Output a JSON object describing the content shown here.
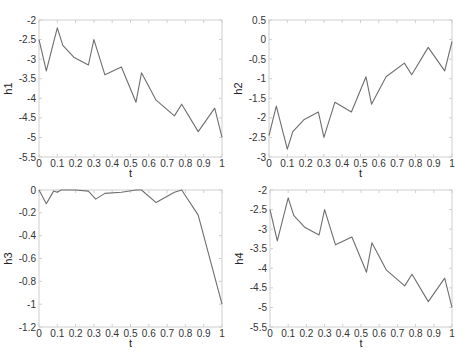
{
  "chart_data": [
    {
      "type": "line",
      "title": "",
      "xlabel": "t",
      "ylabel": "h1",
      "xlim": [
        0,
        1
      ],
      "ylim": [
        -5.5,
        -2
      ],
      "xticks": [
        0,
        0.1,
        0.2,
        0.3,
        0.4,
        0.5,
        0.6,
        0.7,
        0.8,
        0.9,
        1
      ],
      "xtick_labels": [
        "0",
        "0.1",
        "0.2",
        "0.3",
        "0.4",
        "0.5",
        "0.6",
        "0.7",
        "0.8",
        "0.9",
        "1"
      ],
      "yticks": [
        -5.5,
        -5,
        -4.5,
        -4,
        -3.5,
        -3,
        -2.5,
        -2
      ],
      "ytick_labels": [
        "-5.5",
        "-5",
        "-4.5",
        "-4",
        "-3.5",
        "-3",
        "-2.5",
        "-2"
      ],
      "grid": false,
      "x": [
        0,
        0.04,
        0.1,
        0.13,
        0.19,
        0.27,
        0.3,
        0.36,
        0.45,
        0.53,
        0.56,
        0.64,
        0.74,
        0.78,
        0.87,
        0.96,
        1.0
      ],
      "y": [
        -2.5,
        -3.3,
        -2.2,
        -2.65,
        -2.95,
        -3.15,
        -2.5,
        -3.4,
        -3.2,
        -4.1,
        -3.35,
        -4.05,
        -4.45,
        -4.15,
        -4.85,
        -4.25,
        -5.0
      ],
      "box": {
        "left": 39,
        "top": 20,
        "right": 222,
        "bottom": 157
      }
    },
    {
      "type": "line",
      "title": "",
      "xlabel": "t",
      "ylabel": "h2",
      "xlim": [
        0,
        1
      ],
      "ylim": [
        -3,
        0.5
      ],
      "xticks": [
        0,
        0.1,
        0.2,
        0.3,
        0.4,
        0.5,
        0.6,
        0.7,
        0.8,
        0.9,
        1
      ],
      "xtick_labels": [
        "0",
        "0.1",
        "0.2",
        "0.3",
        "0.4",
        "0.5",
        "0.6",
        "0.7",
        "0.8",
        "0.9",
        "1"
      ],
      "yticks": [
        -3,
        -2.5,
        -2,
        -1.5,
        -1,
        -0.5,
        0,
        0.5
      ],
      "ytick_labels": [
        "-3",
        "-2.5",
        "-2",
        "-1.5",
        "-1",
        "-0.5",
        "0",
        "0.5"
      ],
      "grid": false,
      "x": [
        0,
        0.04,
        0.1,
        0.13,
        0.19,
        0.27,
        0.3,
        0.36,
        0.45,
        0.53,
        0.56,
        0.64,
        0.74,
        0.78,
        0.87,
        0.96,
        1.0
      ],
      "y": [
        -2.45,
        -1.7,
        -2.8,
        -2.35,
        -2.05,
        -1.85,
        -2.5,
        -1.6,
        -1.85,
        -0.95,
        -1.65,
        -0.95,
        -0.6,
        -0.9,
        -0.2,
        -0.8,
        -0.05
      ],
      "box": {
        "left": 269,
        "top": 20,
        "right": 452,
        "bottom": 157
      }
    },
    {
      "type": "line",
      "title": "",
      "xlabel": "t",
      "ylabel": "h3",
      "xlim": [
        0,
        1
      ],
      "ylim": [
        -1.2,
        0
      ],
      "xticks": [
        0,
        0.1,
        0.2,
        0.3,
        0.4,
        0.5,
        0.6,
        0.7,
        0.8,
        0.9,
        1
      ],
      "xtick_labels": [
        "0",
        "0.1",
        "0.2",
        "0.3",
        "0.4",
        "0.5",
        "0.6",
        "0.7",
        "0.8",
        "0.9",
        "1"
      ],
      "yticks": [
        -1.2,
        -1,
        -0.8,
        -0.6,
        -0.4,
        -0.2,
        0
      ],
      "ytick_labels": [
        "-1.2",
        "-1",
        "-0.8",
        "-0.6",
        "-0.4",
        "-0.2",
        "0"
      ],
      "grid": false,
      "x": [
        0,
        0.04,
        0.08,
        0.1,
        0.12,
        0.2,
        0.27,
        0.31,
        0.36,
        0.45,
        0.53,
        0.56,
        0.64,
        0.74,
        0.78,
        0.87,
        1.0
      ],
      "y": [
        0,
        -0.12,
        -0.01,
        -0.02,
        0,
        0,
        -0.01,
        -0.08,
        -0.03,
        -0.02,
        0,
        0,
        -0.11,
        -0.02,
        0,
        -0.22,
        -1.0
      ],
      "box": {
        "left": 39,
        "top": 190,
        "right": 222,
        "bottom": 327
      }
    },
    {
      "type": "line",
      "title": "",
      "xlabel": "t",
      "ylabel": "h4",
      "xlim": [
        0,
        1
      ],
      "ylim": [
        -5.5,
        -2
      ],
      "xticks": [
        0,
        0.1,
        0.2,
        0.3,
        0.4,
        0.5,
        0.6,
        0.7,
        0.8,
        0.9,
        1
      ],
      "xtick_labels": [
        "0",
        "0.1",
        "0.2",
        "0.3",
        "0.4",
        "0.5",
        "0.6",
        "0.7",
        "0.8",
        "0.9",
        "1"
      ],
      "yticks": [
        -5.5,
        -5,
        -4.5,
        -4,
        -3.5,
        -3,
        -2.5,
        -2
      ],
      "ytick_labels": [
        "-5.5",
        "-5",
        "-4.5",
        "-4",
        "-3.5",
        "-3",
        "-2.5",
        "-2"
      ],
      "grid": false,
      "x": [
        0,
        0.04,
        0.1,
        0.13,
        0.19,
        0.27,
        0.3,
        0.36,
        0.45,
        0.53,
        0.56,
        0.64,
        0.74,
        0.78,
        0.87,
        0.96,
        1.0
      ],
      "y": [
        -2.5,
        -3.3,
        -2.2,
        -2.65,
        -2.95,
        -3.15,
        -2.5,
        -3.4,
        -3.2,
        -4.1,
        -3.35,
        -4.05,
        -4.45,
        -4.15,
        -4.85,
        -4.25,
        -5.0
      ],
      "box": {
        "left": 270,
        "top": 190,
        "right": 452,
        "bottom": 327
      }
    }
  ],
  "style": {
    "line_color": "#6e6e6e",
    "axis_color": "#cfcfcf",
    "text_color": "#333333"
  }
}
